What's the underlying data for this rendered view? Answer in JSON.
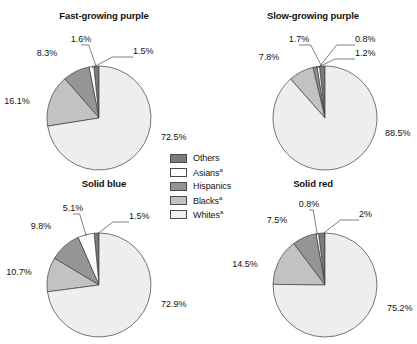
{
  "figure": {
    "background": "#ffffff",
    "width": 417,
    "height": 344
  },
  "legend": {
    "items": [
      {
        "label": "Others",
        "marker": "",
        "color": "#7b7b7b"
      },
      {
        "label": "Asians",
        "marker": "a",
        "color": "#ffffff"
      },
      {
        "label": "Hispanics",
        "marker": "",
        "color": "#959595"
      },
      {
        "label": "Blacks",
        "marker": "a",
        "color": "#c2c2c2"
      },
      {
        "label": "Whites",
        "marker": "a",
        "color": "#eeeeee"
      }
    ]
  },
  "chart_data": [
    {
      "type": "pie",
      "id": "fast-growing-purple",
      "title": "Fast-growing purple",
      "categories": [
        "Others",
        "Asians",
        "Hispanics",
        "Blacks",
        "Whites"
      ],
      "values": [
        1.6,
        1.5,
        8.3,
        16.1,
        72.5
      ],
      "labels": [
        "1.6%",
        "1.5%",
        "8.3%",
        "16.1%",
        "72.5%"
      ],
      "colors": [
        "#7b7b7b",
        "#ffffff",
        "#959595",
        "#c2c2c2",
        "#eeeeee"
      ],
      "start_angle_deg": 0,
      "direction": "counterclockwise",
      "legend": "shared"
    },
    {
      "type": "pie",
      "id": "slow-growing-purple",
      "title": "Slow-growing purple",
      "categories": [
        "Others",
        "Asians",
        "Hispanics",
        "Blacks",
        "Whites"
      ],
      "values": [
        1.7,
        0.8,
        1.2,
        7.8,
        88.5
      ],
      "labels": [
        "1.7%",
        "0.8%",
        "1.2%",
        "7.8%",
        "88.5%"
      ],
      "colors": [
        "#7b7b7b",
        "#ffffff",
        "#959595",
        "#c2c2c2",
        "#eeeeee"
      ],
      "start_angle_deg": 0,
      "direction": "counterclockwise",
      "legend": "shared"
    },
    {
      "type": "pie",
      "id": "solid-blue",
      "title": "Solid blue",
      "categories": [
        "Others",
        "Asians",
        "Hispanics",
        "Blacks",
        "Whites"
      ],
      "values": [
        1.5,
        5.1,
        9.8,
        10.7,
        72.9
      ],
      "labels": [
        "1.5%",
        "5.1%",
        "9.8%",
        "10.7%",
        "72.9%"
      ],
      "colors": [
        "#7b7b7b",
        "#ffffff",
        "#959595",
        "#c2c2c2",
        "#eeeeee"
      ],
      "start_angle_deg": 0,
      "direction": "counterclockwise",
      "legend": "shared"
    },
    {
      "type": "pie",
      "id": "solid-red",
      "title": "Solid red",
      "categories": [
        "Others",
        "Asians",
        "Hispanics",
        "Blacks",
        "Whites"
      ],
      "values": [
        2.0,
        0.8,
        7.5,
        14.5,
        75.2
      ],
      "labels": [
        "2%",
        "0.8%",
        "7.5%",
        "14.5%",
        "75.2%"
      ],
      "colors": [
        "#7b7b7b",
        "#ffffff",
        "#959595",
        "#c2c2c2",
        "#eeeeee"
      ],
      "start_angle_deg": 0,
      "direction": "counterclockwise",
      "legend": "shared"
    }
  ],
  "layout": {
    "panels": [
      {
        "chart": 0,
        "left": 0,
        "top": 10,
        "width": 208,
        "height": 165,
        "cx": 99,
        "cy": 108,
        "r": 52
      },
      {
        "chart": 1,
        "left": 209,
        "top": 10,
        "width": 208,
        "height": 165,
        "cx": 116,
        "cy": 108,
        "r": 52
      },
      {
        "chart": 2,
        "left": 0,
        "top": 178,
        "width": 208,
        "height": 166,
        "cx": 99,
        "cy": 107,
        "r": 52
      },
      {
        "chart": 3,
        "left": 209,
        "top": 178,
        "width": 208,
        "height": 166,
        "cx": 116,
        "cy": 107,
        "r": 52
      }
    ],
    "label_offsets": [
      [
        {
          "dx": -18,
          "dy": -76,
          "anchor": "middle",
          "leader": true
        },
        {
          "dx": 34,
          "dy": -64,
          "anchor": "start",
          "leader": true
        },
        {
          "dx": -52,
          "dy": -62,
          "anchor": "middle",
          "leader": false
        },
        {
          "dx": -82,
          "dy": -14,
          "anchor": "middle",
          "leader": false
        },
        {
          "dx": 62,
          "dy": 22,
          "anchor": "start",
          "leader": false
        }
      ],
      [
        {
          "dx": -26,
          "dy": -76,
          "anchor": "middle",
          "leader": true
        },
        {
          "dx": 30,
          "dy": -76,
          "anchor": "start",
          "leader": true
        },
        {
          "dx": 30,
          "dy": -62,
          "anchor": "start",
          "leader": true
        },
        {
          "dx": -56,
          "dy": -58,
          "anchor": "middle",
          "leader": false
        },
        {
          "dx": 60,
          "dy": 18,
          "anchor": "start",
          "leader": false
        }
      ],
      [
        {
          "dx": 30,
          "dy": -66,
          "anchor": "start",
          "leader": true
        },
        {
          "dx": -26,
          "dy": -74,
          "anchor": "middle",
          "leader": true
        },
        {
          "dx": -58,
          "dy": -56,
          "anchor": "middle",
          "leader": false
        },
        {
          "dx": -80,
          "dy": -10,
          "anchor": "middle",
          "leader": false
        },
        {
          "dx": 62,
          "dy": 22,
          "anchor": "start",
          "leader": false
        }
      ],
      [
        {
          "dx": 34,
          "dy": -68,
          "anchor": "start",
          "leader": true
        },
        {
          "dx": -16,
          "dy": -78,
          "anchor": "middle",
          "leader": true
        },
        {
          "dx": -48,
          "dy": -62,
          "anchor": "middle",
          "leader": false
        },
        {
          "dx": -80,
          "dy": -18,
          "anchor": "middle",
          "leader": false
        },
        {
          "dx": 62,
          "dy": 26,
          "anchor": "start",
          "leader": false
        }
      ]
    ]
  }
}
